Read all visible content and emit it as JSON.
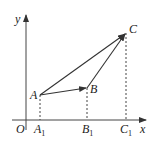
{
  "diagram": {
    "type": "vector-coordinate-diagram",
    "axes": {
      "x_label": "x",
      "y_label": "y",
      "origin_label": "O"
    },
    "points": [
      {
        "name": "A",
        "label": "A",
        "foot_label": "A",
        "foot_sub": "1"
      },
      {
        "name": "B",
        "label": "B",
        "foot_label": "B",
        "foot_sub": "1"
      },
      {
        "name": "C",
        "label": "C",
        "foot_label": "C",
        "foot_sub": "1"
      }
    ],
    "vectors": [
      {
        "from": "A",
        "to": "B"
      },
      {
        "from": "A",
        "to": "C"
      },
      {
        "from": "B",
        "to": "C"
      }
    ],
    "colors": {
      "stroke": "#333333",
      "text": "#222222"
    }
  }
}
